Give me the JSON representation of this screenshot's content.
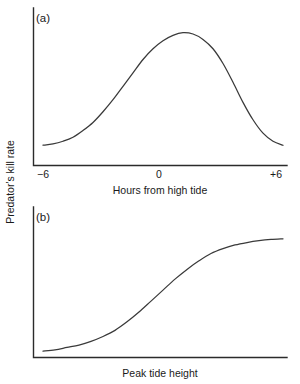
{
  "figure": {
    "shared_y_axis_label": "Predator's kill rate",
    "panels": [
      {
        "tag": "(a)",
        "chart_data": {
          "type": "line",
          "title": "",
          "xlabel": "Hours from high tide",
          "ylabel": "Predator's kill rate",
          "xlim": [
            -6,
            6
          ],
          "ylim": [
            0,
            1
          ],
          "xticks": [
            -6,
            0,
            6
          ],
          "xticklabels": [
            "−6",
            "0",
            "+6"
          ],
          "yticks": [],
          "yticklabels": [],
          "grid": false,
          "legend": false,
          "shape": "unimodal-hump-peak-right-of-zero",
          "x": [
            -6,
            -5.5,
            -5,
            -4.5,
            -4,
            -3.5,
            -3,
            -2.5,
            -2,
            -1.5,
            -1,
            -0.5,
            0,
            0.5,
            1,
            1.5,
            2,
            2.5,
            3,
            3.5,
            4,
            4.5,
            5,
            5.5,
            6
          ],
          "y": [
            0.14,
            0.15,
            0.17,
            0.2,
            0.25,
            0.31,
            0.39,
            0.48,
            0.58,
            0.68,
            0.78,
            0.86,
            0.92,
            0.96,
            0.98,
            0.97,
            0.93,
            0.86,
            0.75,
            0.61,
            0.46,
            0.33,
            0.23,
            0.17,
            0.14
          ]
        }
      },
      {
        "tag": "(b)",
        "chart_data": {
          "type": "line",
          "title": "",
          "xlabel": "Peak tide height",
          "ylabel": "Predator's kill rate",
          "xlim": [
            0,
            1
          ],
          "ylim": [
            0,
            1
          ],
          "xticks": [],
          "xticklabels": [],
          "yticks": [],
          "yticklabels": [],
          "grid": false,
          "legend": false,
          "shape": "sigmoid-increasing",
          "x": [
            0,
            0.05,
            0.1,
            0.15,
            0.2,
            0.25,
            0.3,
            0.35,
            0.4,
            0.45,
            0.5,
            0.55,
            0.6,
            0.65,
            0.7,
            0.75,
            0.8,
            0.85,
            0.9,
            0.95,
            1.0
          ],
          "y": [
            0.04,
            0.05,
            0.07,
            0.09,
            0.12,
            0.16,
            0.21,
            0.28,
            0.36,
            0.45,
            0.54,
            0.63,
            0.71,
            0.78,
            0.84,
            0.88,
            0.91,
            0.93,
            0.945,
            0.955,
            0.96
          ]
        }
      }
    ]
  }
}
